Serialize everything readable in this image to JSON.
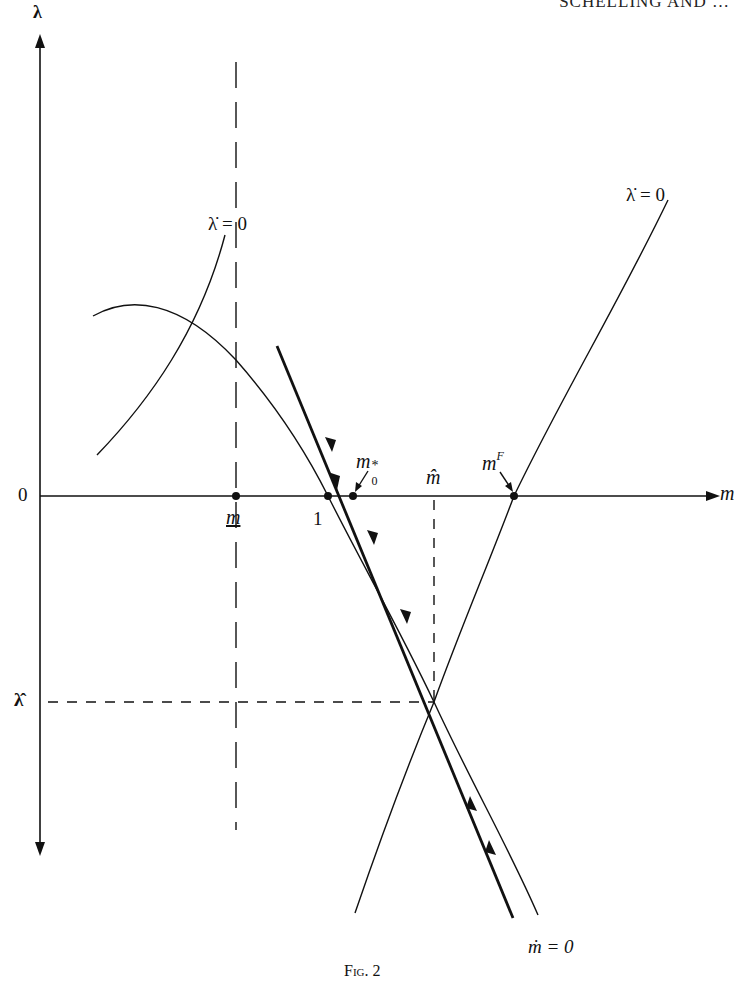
{
  "header": {
    "running_head": "SCHELLING AND …"
  },
  "figure": {
    "caption": "Fig. 2",
    "axes": {
      "y_label": "λ",
      "x_label": "m",
      "origin_label": "0"
    },
    "tick_labels": {
      "m_lower": "m",
      "one": "1",
      "m_hat": "m̂",
      "lambda_hat": "λ̂"
    },
    "point_labels": {
      "m0_star": "m",
      "m0_star_sub": "0",
      "m0_star_sup": "*",
      "mF": "m",
      "mF_sup": "F"
    },
    "curve_labels": {
      "lambda_dot_left": "λ̇ = 0",
      "lambda_dot_right": "λ̇ = 0",
      "m_dot": "ṁ = 0"
    },
    "colors": {
      "ink": "#111111",
      "paper": "#ffffff"
    }
  }
}
